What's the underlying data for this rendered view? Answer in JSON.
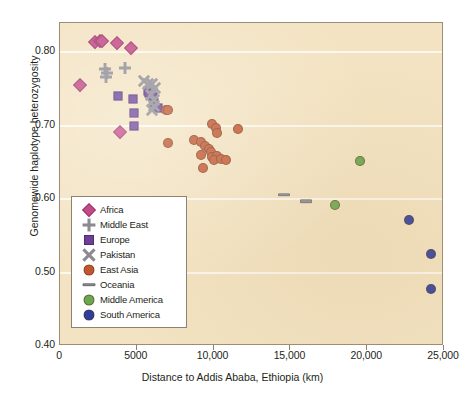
{
  "chart_data": {
    "type": "scatter",
    "title": "",
    "xlabel": "Distance to Addis Ababa, Ethiopia (km)",
    "ylabel": "Genomewide haplotype heterozygosity",
    "xlim": [
      0,
      25000
    ],
    "ylim": [
      0.4,
      0.84
    ],
    "xticks": [
      0,
      5000,
      10000,
      15000,
      20000,
      25000
    ],
    "xtick_labels": [
      "0",
      "5000",
      "10,000",
      "15,000",
      "20,000",
      "25,000"
    ],
    "yticks": [
      0.4,
      0.5,
      0.6,
      0.7,
      0.8
    ],
    "ytick_labels": [
      "0.40",
      "0.50",
      "0.60",
      "0.70",
      "0.80"
    ],
    "grid": "horizontal-white",
    "legend_position": "lower-left-inside",
    "series": [
      {
        "name": "Africa",
        "marker": "diamond",
        "color": "#c24a85",
        "points": [
          [
            2300,
            0.814
          ],
          [
            2600,
            0.816
          ],
          [
            2750,
            0.815
          ],
          [
            3700,
            0.813
          ],
          [
            4600,
            0.806
          ],
          [
            1300,
            0.755
          ],
          [
            3900,
            0.691
          ]
        ]
      },
      {
        "name": "Middle East",
        "marker": "plus",
        "color": "#8c8a91",
        "points": [
          [
            2950,
            0.777
          ],
          [
            3050,
            0.772
          ],
          [
            3000,
            0.766
          ],
          [
            4250,
            0.779
          ]
        ]
      },
      {
        "name": "Europe",
        "marker": "square",
        "color": "#6c4099",
        "points": [
          [
            3750,
            0.741
          ],
          [
            4750,
            0.736
          ],
          [
            4800,
            0.717
          ],
          [
            4850,
            0.7
          ],
          [
            5700,
            0.748
          ],
          [
            5800,
            0.744
          ],
          [
            6050,
            0.739
          ],
          [
            6150,
            0.731
          ],
          [
            6350,
            0.724
          ]
        ]
      },
      {
        "name": "Pakistan",
        "marker": "x",
        "color": "#8c8a91",
        "points": [
          [
            5500,
            0.761
          ],
          [
            5750,
            0.757
          ],
          [
            6000,
            0.757
          ],
          [
            6200,
            0.751
          ],
          [
            5900,
            0.742
          ],
          [
            6100,
            0.735
          ],
          [
            6150,
            0.727
          ],
          [
            6000,
            0.721
          ]
        ]
      },
      {
        "name": "East Asia",
        "marker": "circle",
        "color": "#c2572f",
        "points": [
          [
            6900,
            0.722
          ],
          [
            7050,
            0.721
          ],
          [
            7000,
            0.676
          ],
          [
            9900,
            0.703
          ],
          [
            10150,
            0.697
          ],
          [
            10200,
            0.69
          ],
          [
            11600,
            0.696
          ],
          [
            8750,
            0.681
          ],
          [
            9200,
            0.678
          ],
          [
            9450,
            0.673
          ],
          [
            9700,
            0.669
          ],
          [
            9150,
            0.66
          ],
          [
            9850,
            0.664
          ],
          [
            9900,
            0.658
          ],
          [
            10250,
            0.659
          ],
          [
            10050,
            0.654
          ],
          [
            10450,
            0.655
          ],
          [
            10800,
            0.654
          ],
          [
            9300,
            0.642
          ]
        ]
      },
      {
        "name": "Oceania",
        "marker": "bar",
        "color": "#8c8a91",
        "points": [
          [
            14600,
            0.606
          ],
          [
            16000,
            0.597
          ]
        ]
      },
      {
        "name": "Middle America",
        "marker": "circle",
        "color": "#6aa84f",
        "points": [
          [
            19550,
            0.652
          ],
          [
            17900,
            0.592
          ]
        ]
      },
      {
        "name": "South America",
        "marker": "circle",
        "color": "#2d3f9e",
        "points": [
          [
            22700,
            0.572
          ],
          [
            24150,
            0.525
          ],
          [
            24150,
            0.477
          ]
        ]
      }
    ]
  },
  "legend": {
    "items": [
      {
        "label": "Africa",
        "marker": "diamond",
        "color": "#c24a85"
      },
      {
        "label": "Middle East",
        "marker": "plus",
        "color": "#8c8a91"
      },
      {
        "label": "Europe",
        "marker": "square",
        "color": "#6c4099"
      },
      {
        "label": "Pakistan",
        "marker": "x",
        "color": "#8c8a91"
      },
      {
        "label": "East Asia",
        "marker": "circle",
        "color": "#c2572f"
      },
      {
        "label": "Oceania",
        "marker": "bar",
        "color": "#8c8a91"
      },
      {
        "label": "Middle America",
        "marker": "circle",
        "color": "#6aa84f"
      },
      {
        "label": "South America",
        "marker": "circle",
        "color": "#2d3f9e"
      }
    ]
  },
  "colors": {
    "plot_background": "#f3e3c2",
    "gridline": "#fdfaf2",
    "axis_text": "#231f20",
    "panel_border": "#9b8d76"
  }
}
